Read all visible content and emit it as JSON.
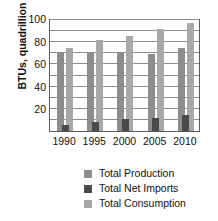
{
  "chart_data": {
    "type": "bar",
    "title": "",
    "subtitle": "",
    "xlabel": "",
    "ylabel": "BTUs, quadrillion",
    "categories": [
      "1990",
      "1995",
      "2000",
      "2005",
      "2010"
    ],
    "series": [
      {
        "name": "Total Production",
        "color": "#8d8d8d",
        "values": [
          70,
          71,
          71,
          69,
          75
        ]
      },
      {
        "name": "Total Net Imports",
        "color": "#4a4a4a",
        "values": [
          5,
          8,
          11,
          12,
          14
        ]
      },
      {
        "name": "Total Consumption",
        "color": "#a8a8a8",
        "values": [
          75,
          82,
          86,
          92,
          97
        ]
      }
    ],
    "ylim": [
      0,
      100
    ],
    "yticks": [
      0,
      20,
      40,
      60,
      80,
      100
    ],
    "ytick_labels": [
      "",
      "20",
      "40",
      "60",
      "80",
      "100"
    ],
    "gridlines": [
      10,
      20,
      30,
      40,
      50,
      60,
      70,
      80,
      90,
      100
    ],
    "grid": true,
    "legend_position": "bottom"
  },
  "axis": {
    "y_title": "BTUs, quadrillion",
    "y_ticks": [
      {
        "value": 100,
        "label": "100"
      },
      {
        "value": 80,
        "label": "80"
      },
      {
        "value": 60,
        "label": "60"
      },
      {
        "value": 40,
        "label": "40"
      },
      {
        "value": 20,
        "label": "20"
      }
    ],
    "x_ticks": [
      {
        "label": "1990"
      },
      {
        "label": "1995"
      },
      {
        "label": "2000"
      },
      {
        "label": "2005"
      },
      {
        "label": "2010"
      }
    ]
  },
  "legend": {
    "items": [
      {
        "label": "Total Production",
        "color": "#8d8d8d",
        "swatch": "square-swatch"
      },
      {
        "label": "Total Net Imports",
        "color": "#4a4a4a",
        "swatch": "square-swatch"
      },
      {
        "label": "Total Consumption",
        "color": "#a8a8a8",
        "swatch": "square-swatch"
      }
    ]
  }
}
